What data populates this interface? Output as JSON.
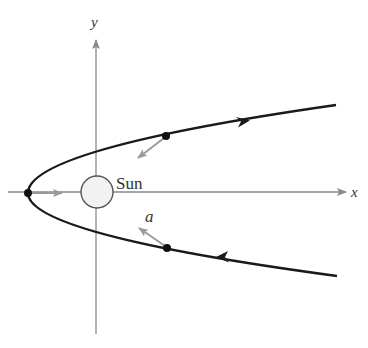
{
  "diagram": {
    "axes": {
      "x_label": "x",
      "y_label": "y"
    },
    "sun": {
      "label": "Sun"
    },
    "acceleration_label": "a",
    "colors": {
      "orbit": "#1a1a1a",
      "axes": "#8a8a8a",
      "vectors": "#8f8f8f",
      "sun_fill": "#f2f2f2",
      "sun_stroke": "#555555"
    }
  }
}
